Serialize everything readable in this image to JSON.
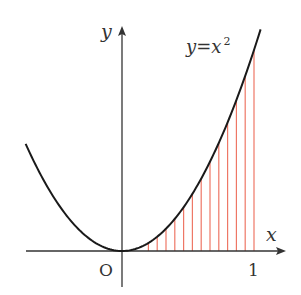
{
  "diagram": {
    "curve_label": "y=x²",
    "curve_label_parts": {
      "lhs": "y",
      "eq": "=",
      "base": "x",
      "exp": "2"
    },
    "x_axis_label": "x",
    "y_axis_label": "y",
    "origin_label": "O",
    "tick_label_1": "1",
    "colors": {
      "curve": "#1a1a1a",
      "axes": "#333333",
      "hatch": "#ee7766"
    }
  },
  "chart_data": {
    "type": "line",
    "title": "",
    "function": "y = x^2",
    "xlabel": "x",
    "ylabel": "y",
    "x_ticks": [
      {
        "value": 0,
        "label": "O"
      },
      {
        "value": 1,
        "label": "1"
      }
    ],
    "curve_domain": [
      -0.73,
      1.05
    ],
    "shaded_region": {
      "from": 0,
      "to": 1,
      "under": "y = x^2",
      "style": "vertical red hatch lines"
    },
    "hatch_x": [
      0.2,
      0.2667,
      0.3333,
      0.4,
      0.4667,
      0.5333,
      0.6,
      0.6667,
      0.7333,
      0.8,
      0.8667,
      0.9333,
      1.0
    ],
    "grid": false
  }
}
